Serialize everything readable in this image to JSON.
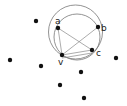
{
  "diagram": {
    "colors": {
      "point": "#111111",
      "circle": "#777777",
      "edge": "#888888",
      "label": "#222222"
    },
    "circles": [
      {
        "id": "outer-circle",
        "cx": 75.5,
        "cy": 32,
        "r": 27
      },
      {
        "id": "inner-circle",
        "cx": 77,
        "cy": 37,
        "r": 23
      }
    ],
    "labeled_points": [
      {
        "label": "a",
        "x": 58,
        "y": 28,
        "lx": 55,
        "ly": 24
      },
      {
        "label": "b",
        "x": 98,
        "y": 27,
        "lx": 101,
        "ly": 31
      },
      {
        "label": "c",
        "x": 92,
        "y": 50,
        "lx": 96,
        "ly": 56
      },
      {
        "label": "v",
        "x": 62,
        "y": 55,
        "lx": 58,
        "ly": 65
      }
    ],
    "points": [
      {
        "x": 36,
        "y": 21
      },
      {
        "x": 10,
        "y": 60
      },
      {
        "x": 41,
        "y": 66
      },
      {
        "x": 116,
        "y": 58
      },
      {
        "x": 81,
        "y": 72
      },
      {
        "x": 60,
        "y": 85
      },
      {
        "x": 84,
        "y": 98
      }
    ],
    "edges": [
      {
        "from": "a",
        "to": "v"
      },
      {
        "from": "a",
        "to": "c"
      },
      {
        "from": "v",
        "to": "b"
      },
      {
        "from": "v",
        "to": "c"
      },
      {
        "from": "v",
        "to": "c",
        "offset": 3
      }
    ]
  }
}
